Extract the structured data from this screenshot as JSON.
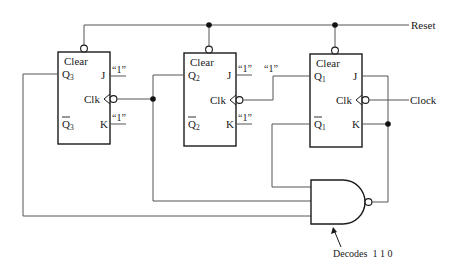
{
  "diagram": {
    "type": "logic-circuit",
    "external_inputs": {
      "reset_label": "Reset",
      "clock_label": "Clock"
    },
    "flip_flops": [
      {
        "id": "ff3",
        "clear_label": "Clear",
        "q_label": "Q",
        "q_sub": "3",
        "qbar_label": "Q",
        "qbar_sub": "3",
        "j_label": "J",
        "k_label": "K",
        "clk_label": "Clk",
        "j_input": "“1”",
        "k_input": "“1”"
      },
      {
        "id": "ff2",
        "clear_label": "Clear",
        "q_label": "Q",
        "q_sub": "2",
        "qbar_label": "Q",
        "qbar_sub": "2",
        "j_label": "J",
        "k_label": "K",
        "clk_label": "Clk",
        "j_input": "“1”",
        "k_input": "“1”"
      },
      {
        "id": "ff1",
        "clear_label": "Clear",
        "q_label": "Q",
        "q_sub": "1",
        "qbar_label": "Q",
        "qbar_sub": "1",
        "j_label": "J",
        "k_label": "K",
        "clk_label": "Clk"
      }
    ],
    "q1_line_label": "“1”",
    "nand_gate": {
      "inputs": [
        "Qbar1",
        "Q2",
        "Q3"
      ],
      "annotation": "Decodes  1 1 0"
    },
    "colors": {
      "wire": "#555555",
      "outline": "#1a1a1a",
      "background": "#ffffff"
    }
  }
}
